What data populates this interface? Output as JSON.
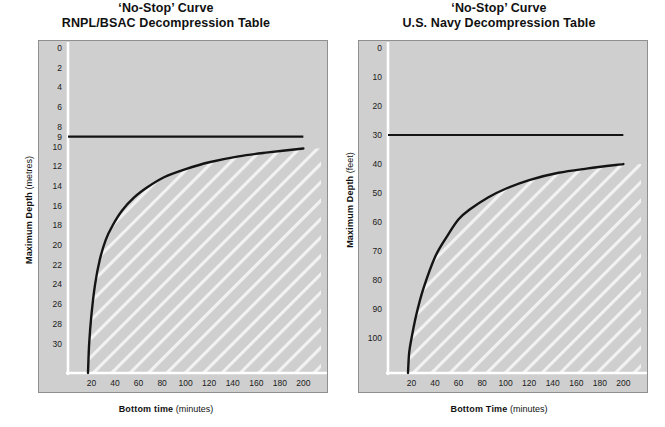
{
  "page": {
    "background_color": "#ffffff",
    "panel_color": "#cfcfcf",
    "curve_color": "#141414",
    "hatch_color": "#f2f2f2",
    "axis_color": "#ffffff"
  },
  "charts": [
    {
      "id": "rnpl-bsac",
      "title_line1": "‘No-Stop’ Curve",
      "title_line2": "RNPL/BSAC Decompression Table",
      "ylabel_bold": "Maximum Depth",
      "ylabel_unit": "(metres)",
      "xlabel_bold": "Bottom time",
      "xlabel_unit": "(minutes)",
      "chart_data": {
        "type": "line",
        "title": "'No-Stop' Curve RNPL/BSAC Decompression Table",
        "xlabel": "Bottom time (minutes)",
        "ylabel": "Maximum Depth (metres)",
        "xlim": [
          0,
          215
        ],
        "ylim": [
          0,
          33
        ],
        "y_inverted": true,
        "grid": false,
        "legend": "none",
        "xticks": [
          20,
          40,
          60,
          80,
          100,
          120,
          140,
          160,
          180,
          200
        ],
        "yticks": [
          0,
          2,
          4,
          6,
          8,
          9,
          10,
          12,
          14,
          16,
          18,
          20,
          22,
          24,
          26,
          28,
          30
        ],
        "series": [
          {
            "name": "no-stop ceiling",
            "type": "horizontal-line",
            "y": 9,
            "x_from": 0,
            "x_to": 200
          },
          {
            "name": "no-stop curve",
            "type": "curve",
            "x": [
              17,
              18,
              20,
              23,
              27,
              32,
              38,
              46,
              56,
              68,
              82,
              100,
              120,
              145,
              170,
              200
            ],
            "y": [
              33,
              30,
              27,
              24,
              21.5,
              19.5,
              18,
              16.5,
              15.2,
              14.1,
              13.1,
              12.3,
              11.6,
              11.0,
              10.6,
              10.2
            ]
          }
        ],
        "shaded_region": {
          "label": "no-decompression region",
          "fill": "diagonal-hatch",
          "bounded_by": "no-stop curve"
        }
      }
    },
    {
      "id": "us-navy",
      "title_line1": "‘No-Stop’ Curve",
      "title_line2": "U.S. Navy Decompression Table",
      "ylabel_bold": "Maximum Depth",
      "ylabel_unit": "(feet)",
      "xlabel_bold": "Bottom Time",
      "xlabel_unit": "(minutes)",
      "chart_data": {
        "type": "line",
        "title": "'No-Stop' Curve U.S. Navy Decompression Table",
        "xlabel": "Bottom Time (minutes)",
        "ylabel": "Maximum Depth (feet)",
        "xlim": [
          0,
          215
        ],
        "ylim": [
          0,
          112
        ],
        "y_inverted": true,
        "grid": false,
        "legend": "none",
        "xticks": [
          20,
          40,
          60,
          80,
          100,
          120,
          140,
          160,
          180,
          200
        ],
        "yticks": [
          0,
          10,
          20,
          30,
          40,
          50,
          60,
          70,
          80,
          90,
          100
        ],
        "series": [
          {
            "name": "no-stop ceiling",
            "type": "horizontal-line",
            "y": 30,
            "x_from": 0,
            "x_to": 200
          },
          {
            "name": "no-stop curve",
            "type": "curve",
            "x": [
              17,
              18,
              20,
              24,
              30,
              40,
              50,
              60,
              70,
              85,
              100,
              120,
              145,
              170,
              200
            ],
            "y": [
              112,
              105,
              100,
              92,
              83,
              72,
              65,
              59,
              55.5,
              51.5,
              48.5,
              45.5,
              43,
              41.5,
              40
            ]
          }
        ],
        "shaded_region": {
          "label": "no-decompression region",
          "fill": "diagonal-hatch",
          "bounded_by": "no-stop curve"
        }
      }
    }
  ]
}
